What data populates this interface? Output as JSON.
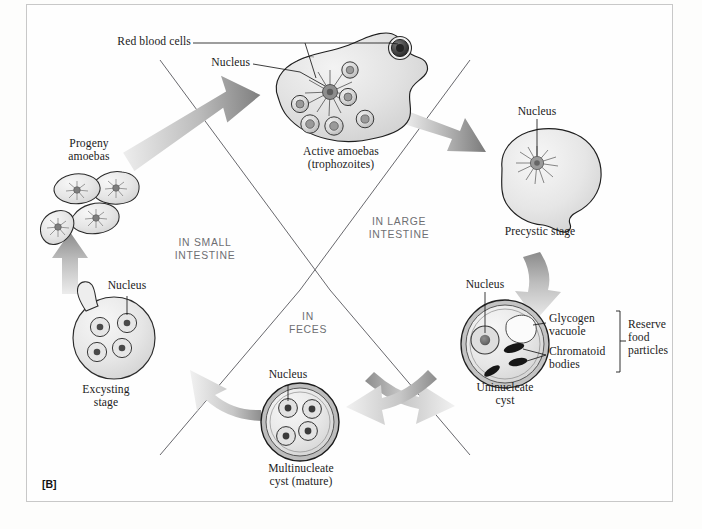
{
  "figure": {
    "panel_tag": "[B]"
  },
  "regions": [
    {
      "name": "in-small-intestine",
      "text": "IN SMALL\nINTESTINE"
    },
    {
      "name": "in-large-intestine",
      "text": "IN LARGE\nINTESTINE"
    },
    {
      "name": "in-feces",
      "text": "IN\nFECES"
    }
  ],
  "stages": [
    {
      "id": "trophozoite",
      "caption": "Active amoebas\n(trophozoites)",
      "callouts": [
        {
          "name": "red-blood-cells",
          "text": "Red blood cells"
        },
        {
          "name": "nucleus",
          "text": "Nucleus"
        }
      ],
      "red_blood_cell_count": 7,
      "nucleus_count": 1
    },
    {
      "id": "precystic",
      "caption": "Precystic stage",
      "callouts": [
        {
          "name": "nucleus",
          "text": "Nucleus"
        }
      ],
      "nucleus_count": 1
    },
    {
      "id": "uninucleate-cyst",
      "caption": "Uninucleate\ncyst",
      "callouts": [
        {
          "name": "nucleus",
          "text": "Nucleus"
        },
        {
          "name": "glycogen-vacuole",
          "text": "Glycogen\nvacuole"
        },
        {
          "name": "chromatoid-bodies",
          "text": "Chromatoid\nbodies"
        },
        {
          "name": "reserve-food-particles",
          "text": "Reserve\nfood\nparticles"
        }
      ],
      "nucleus_count": 1,
      "chromatoid_body_count": 3,
      "glycogen_vacuole_count": 1
    },
    {
      "id": "multinucleate-cyst",
      "caption": "Multinucleate\ncyst (mature)",
      "callouts": [
        {
          "name": "nucleus",
          "text": "Nucleus"
        }
      ],
      "nucleus_count": 4
    },
    {
      "id": "excysting",
      "caption": "Excysting\nstage",
      "callouts": [
        {
          "name": "nucleus",
          "text": "Nucleus"
        }
      ],
      "nucleus_count": 4
    },
    {
      "id": "progeny-amoebas",
      "caption": "Progeny\namoebas",
      "callouts": [],
      "cell_count": 4
    }
  ],
  "flow_arrows": [
    {
      "from": "progeny-amoebas",
      "to": "trophozoite"
    },
    {
      "from": "trophozoite",
      "to": "precystic"
    },
    {
      "from": "precystic",
      "to": "uninucleate-cyst"
    },
    {
      "from": "uninucleate-cyst",
      "to": "multinucleate-cyst"
    },
    {
      "from": "multinucleate-cyst",
      "to": "excysting"
    },
    {
      "from": "excysting",
      "to": "progeny-amoebas"
    }
  ],
  "colors": {
    "frame_border": "#c8c8c8",
    "arrow_dark": "#7b7b7b",
    "arrow_light": "#e8e8e8",
    "cell_outline": "#2b2b2b",
    "cell_fill": "#e4e4e4",
    "region_text": "#6e6e72",
    "label_text": "#1b1b1b",
    "chromatoid": "#1c1c1c"
  }
}
